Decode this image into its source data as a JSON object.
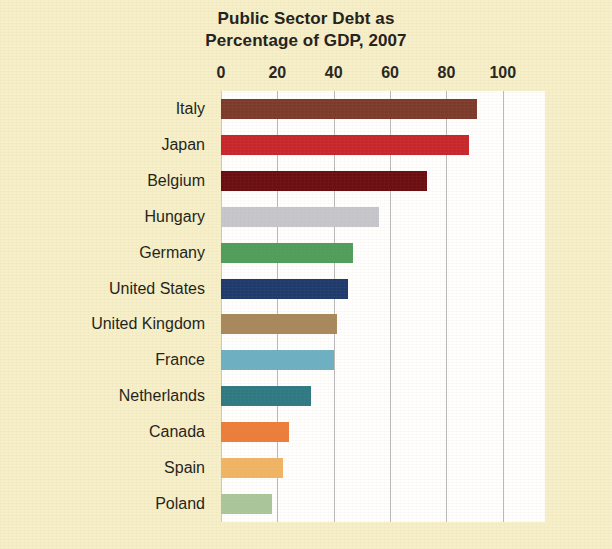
{
  "chart_data": {
    "type": "bar",
    "orientation": "horizontal",
    "title": "Public Sector Debt as Percentage of GDP, 2007",
    "title_lines": [
      "Public Sector Debt as",
      "Percentage of GDP, 2007"
    ],
    "xlabel": "",
    "ylabel": "",
    "xlim": [
      0,
      115
    ],
    "xticks": [
      0,
      20,
      40,
      60,
      80,
      100
    ],
    "xtick_labels": [
      "0",
      "20",
      "40",
      "60",
      "80",
      "100"
    ],
    "grid": true,
    "grid_axis": "x",
    "legend": "none",
    "categories": [
      "Italy",
      "Japan",
      "Belgium",
      "Hungary",
      "Germany",
      "United States",
      "United Kingdom",
      "France",
      "Netherlands",
      "Canada",
      "Spain",
      "Poland"
    ],
    "values": [
      91,
      88,
      73,
      56,
      47,
      45,
      41,
      40,
      32,
      24,
      22,
      18
    ],
    "colors": [
      "#7d3a2c",
      "#c9262c",
      "#6b0d12",
      "#c6c6cd",
      "#4f9e5c",
      "#1e3a6e",
      "#a8885c",
      "#6cb0c5",
      "#2e7a84",
      "#ee7d3a",
      "#f1b464",
      "#a9c79b"
    ],
    "bars": [
      {
        "label": "Italy",
        "value": 91,
        "color": "#7d3a2c"
      },
      {
        "label": "Japan",
        "value": 88,
        "color": "#c9262c"
      },
      {
        "label": "Belgium",
        "value": 73,
        "color": "#6b0d12"
      },
      {
        "label": "Hungary",
        "value": 56,
        "color": "#c6c6cd"
      },
      {
        "label": "Germany",
        "value": 47,
        "color": "#4f9e5c"
      },
      {
        "label": "United States",
        "value": 45,
        "color": "#1e3a6e"
      },
      {
        "label": "United Kingdom",
        "value": 41,
        "color": "#a8885c"
      },
      {
        "label": "France",
        "value": 40,
        "color": "#6cb0c5"
      },
      {
        "label": "Netherlands",
        "value": 32,
        "color": "#2e7a84"
      },
      {
        "label": "Canada",
        "value": 24,
        "color": "#ee7d3a"
      },
      {
        "label": "Spain",
        "value": 22,
        "color": "#f1b464"
      },
      {
        "label": "Poland",
        "value": 18,
        "color": "#a9c79b"
      }
    ]
  },
  "page": {
    "background_color": "#f6efc9",
    "plot_background_color": "#ffffff",
    "text_color": "#1e1e19",
    "gridline_color": "#b9b9b9"
  }
}
